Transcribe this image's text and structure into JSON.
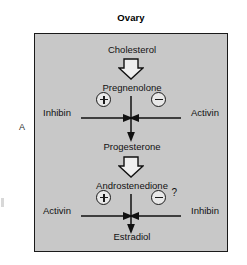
{
  "figure": {
    "panel_letter": "A",
    "title": "Ovary",
    "box_fill_color": "#c8c8c8",
    "box_border_color": "#1a1a1a"
  },
  "pathway": {
    "steps": [
      {
        "id": "cholesterol",
        "label": "Cholesterol"
      },
      {
        "id": "pregnenolone",
        "label": "Pregnenolone"
      },
      {
        "id": "progesterone",
        "label": "Progesterone"
      },
      {
        "id": "androstenedione",
        "label": "Androstenedione"
      },
      {
        "id": "estradiol",
        "label": "Estradiol"
      }
    ],
    "conversions": [
      {
        "id": "chol-to-preg",
        "arrow": "block-open-down"
      },
      {
        "id": "preg-to-prog",
        "arrow": "thin-down"
      },
      {
        "id": "prog-to-andro",
        "arrow": "block-open-down"
      },
      {
        "id": "andro-to-estra",
        "arrow": "thin-down"
      }
    ]
  },
  "regulators": {
    "upper": {
      "left": {
        "label": "Inhibin",
        "sign": "+",
        "sign_name": "plus-circle"
      },
      "right": {
        "label": "Activin",
        "sign": "−",
        "sign_name": "minus-circle"
      }
    },
    "lower": {
      "left": {
        "label": "Activin",
        "sign": "+",
        "sign_name": "plus-circle"
      },
      "right": {
        "label": "Inhibin",
        "sign": "−",
        "sign_name": "minus-circle",
        "uncertainty": "?"
      }
    }
  }
}
